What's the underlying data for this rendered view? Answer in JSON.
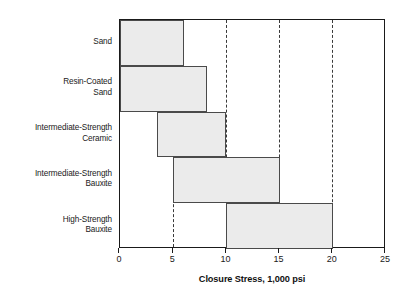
{
  "chart_data": {
    "type": "bar",
    "orientation": "horizontal",
    "title": "",
    "xlabel": "Closure Stress, 1,000 psi",
    "ylabel": "",
    "xlim": [
      0,
      25
    ],
    "xticks": [
      0,
      5,
      10,
      15,
      20,
      25
    ],
    "xtick_labels": [
      "0",
      "5",
      "10",
      "15",
      "20",
      "25"
    ],
    "gridlines": [
      5,
      10,
      15,
      20
    ],
    "grid": true,
    "grid_style": "dashed",
    "legend": null,
    "categories": [
      "Sand",
      "Resin-Coated\nSand",
      "Intermediate-Strength\nCeramic",
      "Intermediate-Strength\nBauxite",
      "High-Strength\nBauxite"
    ],
    "bars": [
      {
        "label": "Sand",
        "start": 0,
        "end": 6
      },
      {
        "label": "Resin-Coated Sand",
        "start": 0,
        "end": 8.2
      },
      {
        "label": "Intermediate-Strength Ceramic",
        "start": 3.5,
        "end": 10
      },
      {
        "label": "Intermediate-Strength Bauxite",
        "start": 5,
        "end": 15
      },
      {
        "label": "High-Strength Bauxite",
        "start": 10,
        "end": 20
      }
    ],
    "bar_fill_color": "#ebebeb",
    "bar_edge_color": "#4a4a4a",
    "axis_color": "#1a1a1a"
  }
}
